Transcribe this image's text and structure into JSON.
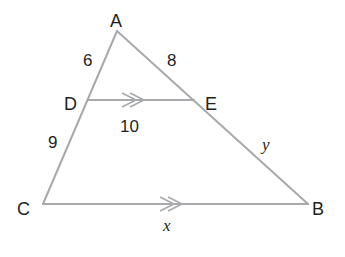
{
  "diagram": {
    "type": "triangle-with-parallel-segment",
    "colors": {
      "line": "#a7a9ac",
      "text": "#231f20",
      "background": "#ffffff"
    },
    "vertices": [
      {
        "name": "A",
        "x": 117,
        "y": 31
      },
      {
        "name": "B",
        "x": 308,
        "y": 204
      },
      {
        "name": "C",
        "x": 43,
        "y": 204
      },
      {
        "name": "D",
        "x": 88,
        "y": 100
      },
      {
        "name": "E",
        "x": 194,
        "y": 100
      }
    ],
    "labels": {
      "A": "A",
      "B": "B",
      "C": "C",
      "D": "D",
      "E": "E",
      "AD": "6",
      "AE": "8",
      "DE": "10",
      "DC": "9",
      "EB": "y",
      "CB": "x"
    },
    "parallel_marks": [
      {
        "segment": "DE",
        "mark": ">>"
      },
      {
        "segment": "CB",
        "mark": ">>"
      }
    ]
  }
}
